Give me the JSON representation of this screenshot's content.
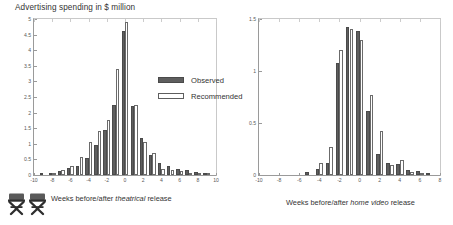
{
  "figure": {
    "title": "Advertising spending in $ million"
  },
  "legend": {
    "position": "center",
    "entries": [
      {
        "label": "Observed",
        "style": "filled",
        "color": "#5e5e5e"
      },
      {
        "label": "Recommended",
        "style": "outline",
        "color": "#ffffff"
      }
    ]
  },
  "icons": {
    "chair": "directors-chair-icon"
  },
  "captions": {
    "left": {
      "pre": "Weeks before/after ",
      "em": "theatrical",
      "post": " release"
    },
    "right": {
      "pre": "Weeks before/after ",
      "em": "home video",
      "post": " release"
    }
  },
  "chart_data": [
    {
      "type": "bar",
      "id": "theatrical",
      "title": "Advertising spending in $ million",
      "xlabel": "Weeks before/after theatrical release",
      "ylabel": "Advertising spending in $ million",
      "xlim": [
        -10,
        10
      ],
      "ylim": [
        0,
        5
      ],
      "yticks": [
        0,
        0.5,
        1,
        1.5,
        2,
        2.5,
        3,
        3.5,
        4,
        4.5,
        5
      ],
      "ytick_labels": [
        "0",
        "0.5",
        "1",
        "1.5",
        "2",
        "2.5",
        "3",
        "3.5",
        "4",
        "4.5",
        "5"
      ],
      "xticks": [
        -10,
        -8,
        -6,
        -4,
        -2,
        0,
        2,
        4,
        6,
        8,
        10
      ],
      "xtick_labels": [
        "-10",
        "-8",
        "-6",
        "-4",
        "-2",
        "0",
        "2",
        "4",
        "6",
        "8",
        "10"
      ],
      "grid": false,
      "legend": [
        "Observed",
        "Recommended"
      ],
      "x": [
        -10,
        -9,
        -8,
        -7,
        -6,
        -5,
        -4,
        -3,
        -2,
        -1,
        0,
        1,
        2,
        3,
        4,
        5,
        6,
        7,
        8,
        9,
        10
      ],
      "series": [
        {
          "name": "Observed",
          "color": "#5e5e5e",
          "values": [
            0.0,
            0.02,
            0.06,
            0.12,
            0.22,
            0.3,
            0.55,
            0.95,
            1.45,
            2.25,
            4.6,
            2.2,
            1.2,
            0.65,
            0.4,
            0.28,
            0.2,
            0.15,
            0.1,
            0.05,
            0.0
          ]
        },
        {
          "name": "Recommended",
          "color": "#ffffff",
          "values": [
            0.0,
            0.0,
            0.04,
            0.16,
            0.3,
            0.58,
            1.05,
            1.4,
            1.75,
            3.4,
            4.9,
            2.25,
            1.05,
            0.7,
            0.2,
            0.15,
            0.12,
            0.08,
            0.05,
            0.02,
            0.0
          ]
        }
      ]
    },
    {
      "type": "bar",
      "id": "home-video",
      "title": "Advertising spending in $ million",
      "xlabel": "Weeks before/after home video release",
      "ylabel": "Advertising spending in $ million",
      "xlim": [
        -10,
        8
      ],
      "ylim": [
        0,
        1.5
      ],
      "yticks": [
        0,
        0.5,
        1,
        1.5
      ],
      "ytick_labels": [
        "0",
        "0.5",
        "1",
        "1.5"
      ],
      "xticks": [
        -10,
        -8,
        -6,
        -4,
        -2,
        0,
        2,
        4,
        6,
        8
      ],
      "xtick_labels": [
        "-10",
        "-8",
        "-6",
        "-4",
        "-2",
        "0",
        "2",
        "4",
        "6",
        "8"
      ],
      "grid": false,
      "legend": [
        "Observed",
        "Recommended"
      ],
      "x": [
        -10,
        -9,
        -8,
        -7,
        -6,
        -5,
        -4,
        -3,
        -2,
        -1,
        0,
        1,
        2,
        3,
        4,
        5,
        6,
        7,
        8
      ],
      "series": [
        {
          "name": "Observed",
          "color": "#5e5e5e",
          "values": [
            0.0,
            0.0,
            0.0,
            0.0,
            0.0,
            0.03,
            0.06,
            0.12,
            1.08,
            1.42,
            1.38,
            0.62,
            0.2,
            0.12,
            0.11,
            0.05,
            0.04,
            0.02,
            0.0
          ]
        },
        {
          "name": "Recommended",
          "color": "#ffffff",
          "values": [
            0.0,
            0.0,
            0.0,
            0.0,
            0.0,
            0.0,
            0.12,
            0.27,
            1.2,
            1.4,
            1.3,
            0.77,
            0.42,
            0.1,
            0.14,
            0.03,
            0.02,
            0.0,
            0.0
          ]
        }
      ]
    }
  ]
}
